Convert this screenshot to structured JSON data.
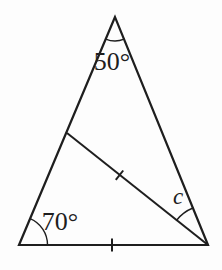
{
  "diagram": {
    "type": "triangle-angle-figure",
    "labels": {
      "apex_angle": "50°",
      "left_base_angle": "70°",
      "unknown_angle": "c"
    },
    "marks": {
      "cevian_tick": "single-tick",
      "base_tick": "single-tick"
    },
    "colors": {
      "line": "#1e1e1e",
      "background": "#fdfdfd"
    }
  }
}
